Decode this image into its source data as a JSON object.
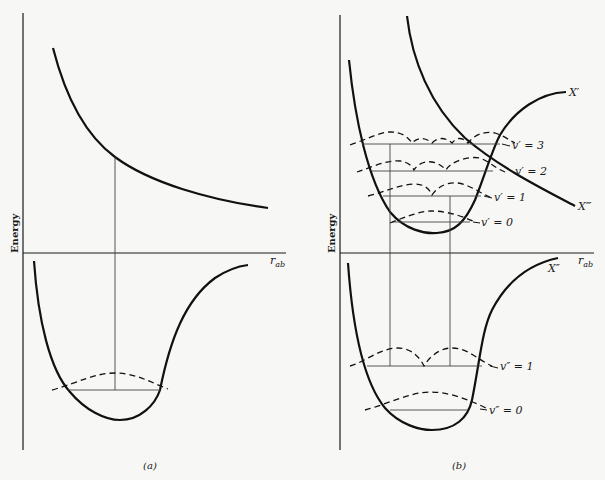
{
  "figure": {
    "panel_a": {
      "caption": "(a)",
      "y_axis_label": "Energy",
      "x_axis_label": "r",
      "x_axis_label_sub": "ab"
    },
    "panel_b": {
      "caption": "(b)",
      "y_axis_label": "Energy",
      "x_axis_label": "r",
      "x_axis_label_sub": "ab",
      "curves": {
        "upper_bound": "X′",
        "repulsive": "X‴",
        "ground": "X″"
      },
      "upper_levels": [
        {
          "label": "v′ = 3"
        },
        {
          "label": "v′ = 2"
        },
        {
          "label": "v′ = 1"
        },
        {
          "label": "v′ = 0"
        }
      ],
      "lower_levels": [
        {
          "label": "v″ = 1"
        },
        {
          "label": "v″ = 0"
        }
      ]
    }
  },
  "colors": {
    "ink": "#1a1a1a",
    "thin_line": "#444444",
    "background": "#f7f7f5"
  }
}
